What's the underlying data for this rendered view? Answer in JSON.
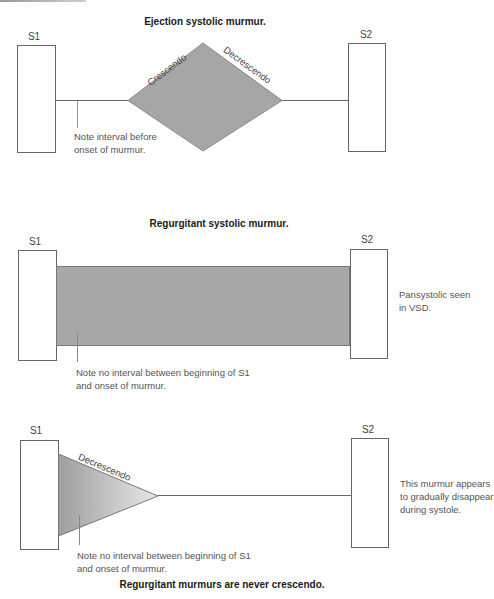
{
  "panels": [
    {
      "title": "Ejection systolic murmur.",
      "s1_label": "S1",
      "s2_label": "S2",
      "shape": "diamond",
      "shape_labels": {
        "rising": "Crescendo",
        "falling": "Decrescendo"
      },
      "note": [
        "Note interval before",
        "onset of murmur."
      ],
      "side_note": []
    },
    {
      "title": "Regurgitant systolic murmur.",
      "s1_label": "S1",
      "s2_label": "S2",
      "shape": "rectangle",
      "note": [
        "Note no interval between beginning of S1",
        "and onset of murmur."
      ],
      "side_note": [
        "Pansystolic seen",
        "in VSD."
      ]
    },
    {
      "title": "Regurgitant murmurs are never crescendo.",
      "s1_label": "S1",
      "s2_label": "S2",
      "shape": "triangle",
      "shape_labels": {
        "falling": "Decrescendo"
      },
      "note": [
        "Note no interval between beginning of S1",
        "and onset of murmur."
      ],
      "side_note": [
        "This murmur appears",
        "to gradually disappear",
        "during systole."
      ]
    }
  ],
  "colors": {
    "murmur_fill": "#a6a6a6",
    "outline": "#555555",
    "text": "#333333"
  }
}
